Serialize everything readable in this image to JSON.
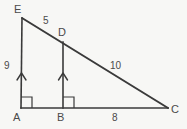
{
  "figure": {
    "type": "geometry-diagram",
    "background_color": "#f7f7f5",
    "stroke_color": "#3a3a3a",
    "text_color": "#4a4a4a",
    "width": 187,
    "height": 129
  },
  "vertices": {
    "E": {
      "label": "E",
      "x": 22,
      "y": 18,
      "label_x": 14,
      "label_y": 4
    },
    "D": {
      "label": "D",
      "x": 63,
      "y": 42,
      "label_x": 58,
      "label_y": 27
    },
    "A": {
      "label": "A",
      "x": 21,
      "y": 108,
      "label_x": 13,
      "label_y": 112
    },
    "B": {
      "label": "B",
      "x": 63,
      "y": 108,
      "label_x": 57,
      "label_y": 112
    },
    "C": {
      "label": "C",
      "x": 168,
      "y": 108,
      "label_x": 171,
      "label_y": 104
    }
  },
  "segments": [
    {
      "name": "AE",
      "from": "A",
      "to": "E"
    },
    {
      "name": "EC",
      "from": "E",
      "to": "C"
    },
    {
      "name": "AC",
      "from": "A",
      "to": "C"
    },
    {
      "name": "BD",
      "from": "B",
      "to": "D"
    }
  ],
  "measures": {
    "AE": {
      "value": "9",
      "x": 4,
      "y": 61
    },
    "ED": {
      "value": "5",
      "x": 43,
      "y": 16
    },
    "DC": {
      "value": "10",
      "x": 110,
      "y": 61
    },
    "BC": {
      "value": "8",
      "x": 112,
      "y": 113
    }
  },
  "marks": {
    "right_angles": [
      {
        "name": "right-angle-A",
        "at": "A"
      },
      {
        "name": "right-angle-B",
        "at": "B"
      }
    ],
    "parallel_arrows": [
      {
        "name": "parallel-arrow-AE",
        "on": "AE"
      },
      {
        "name": "parallel-arrow-BD",
        "on": "BD"
      }
    ]
  }
}
